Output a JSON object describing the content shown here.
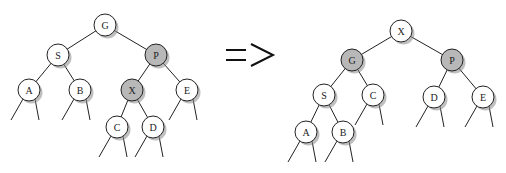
{
  "colors": {
    "normal": "#ffffff",
    "highlight": "#b8b8b8",
    "stroke": "#222222"
  },
  "arrow_symbol": "=>",
  "before": {
    "nodes": [
      {
        "id": "G",
        "label": "G",
        "x": 105,
        "y": 25,
        "highlight": false
      },
      {
        "id": "S",
        "label": "S",
        "x": 58,
        "y": 55,
        "highlight": false
      },
      {
        "id": "P",
        "label": "P",
        "x": 156,
        "y": 55,
        "highlight": true
      },
      {
        "id": "A",
        "label": "A",
        "x": 29,
        "y": 90,
        "highlight": false
      },
      {
        "id": "B",
        "label": "B",
        "x": 80,
        "y": 90,
        "highlight": false
      },
      {
        "id": "X",
        "label": "X",
        "x": 132,
        "y": 90,
        "highlight": true
      },
      {
        "id": "E",
        "label": "E",
        "x": 187,
        "y": 90,
        "highlight": false
      },
      {
        "id": "C",
        "label": "C",
        "x": 117,
        "y": 127,
        "highlight": false
      },
      {
        "id": "D",
        "label": "D",
        "x": 153,
        "y": 127,
        "highlight": false
      }
    ],
    "edges": [
      [
        "G",
        "S"
      ],
      [
        "G",
        "P"
      ],
      [
        "S",
        "A"
      ],
      [
        "S",
        "B"
      ],
      [
        "P",
        "X"
      ],
      [
        "P",
        "E"
      ],
      [
        "X",
        "C"
      ],
      [
        "X",
        "D"
      ]
    ],
    "leaves": [
      "A",
      "B",
      "E",
      "C",
      "D"
    ]
  },
  "after": {
    "nodes": [
      {
        "id": "X",
        "label": "X",
        "x": 401,
        "y": 31,
        "highlight": false
      },
      {
        "id": "G",
        "label": "G",
        "x": 352,
        "y": 60,
        "highlight": true
      },
      {
        "id": "P",
        "label": "P",
        "x": 452,
        "y": 60,
        "highlight": true
      },
      {
        "id": "S",
        "label": "S",
        "x": 324,
        "y": 95,
        "highlight": false
      },
      {
        "id": "C",
        "label": "C",
        "x": 373,
        "y": 95,
        "highlight": false
      },
      {
        "id": "D",
        "label": "D",
        "x": 434,
        "y": 97,
        "highlight": false
      },
      {
        "id": "E",
        "label": "E",
        "x": 483,
        "y": 97,
        "highlight": false
      },
      {
        "id": "A",
        "label": "A",
        "x": 306,
        "y": 132,
        "highlight": false
      },
      {
        "id": "B",
        "label": "B",
        "x": 343,
        "y": 132,
        "highlight": false
      }
    ],
    "edges": [
      [
        "X",
        "G"
      ],
      [
        "X",
        "P"
      ],
      [
        "G",
        "S"
      ],
      [
        "G",
        "C"
      ],
      [
        "P",
        "D"
      ],
      [
        "P",
        "E"
      ],
      [
        "S",
        "A"
      ],
      [
        "S",
        "B"
      ]
    ],
    "leaves": [
      "C",
      "D",
      "E",
      "A",
      "B"
    ]
  }
}
